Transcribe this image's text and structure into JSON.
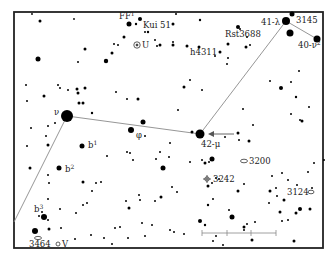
{
  "map": {
    "type": "star-chart",
    "frame_color": "#222222",
    "star_color": "#000000",
    "line_color": "#8a8a8a",
    "background": "#ffffff",
    "labels": [
      {
        "id": "ff",
        "text": "FF",
        "sup": "1"
      },
      {
        "id": "kui51",
        "text": "Kui 51"
      },
      {
        "id": "u",
        "text": "U",
        "symbol": "circled-dot"
      },
      {
        "id": "rst3688",
        "text": "Rst3688"
      },
      {
        "id": "h4311",
        "text": "h4311"
      },
      {
        "id": "lambda41",
        "text": "41-λ"
      },
      {
        "id": "s3145",
        "text": "3145"
      },
      {
        "id": "nu40",
        "text": "40-ν",
        "sup": "2"
      },
      {
        "id": "nu",
        "text": "ν"
      },
      {
        "id": "mu42",
        "text": "42-μ"
      },
      {
        "id": "phi",
        "text": "φ"
      },
      {
        "id": "b1",
        "text": "b",
        "sup": "1"
      },
      {
        "id": "b2",
        "text": "b",
        "sup": "2"
      },
      {
        "id": "b3",
        "text": "b",
        "sup": "3"
      },
      {
        "id": "n3200",
        "text": "3200",
        "symbol": "galaxy"
      },
      {
        "id": "n3242",
        "text": "3242",
        "symbol": "planetary-nebula"
      },
      {
        "id": "n3124",
        "text": "3124",
        "symbol": "galaxy"
      },
      {
        "id": "n3464",
        "text": "3464",
        "symbol": "galaxy"
      },
      {
        "id": "v",
        "text": "V",
        "symbol": "variable-star"
      }
    ],
    "scale_bar": {
      "divisions": 4
    },
    "pointer_arrow": {
      "target": "42-μ"
    }
  }
}
